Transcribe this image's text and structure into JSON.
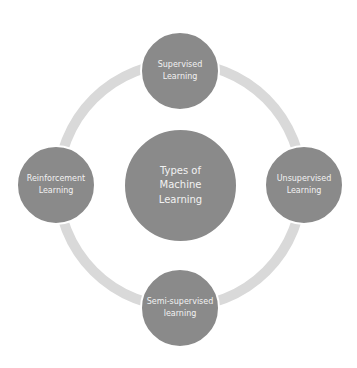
{
  "diagram": {
    "center": {
      "label": "Types of\nMachine\nLearning"
    },
    "nodes": [
      {
        "id": "top",
        "label": "Supervised\nLearning"
      },
      {
        "id": "right",
        "label": "Unsupervised\nLearning"
      },
      {
        "id": "bottom",
        "label": "Semi-supervised\nlearning"
      },
      {
        "id": "left",
        "label": "Reinforcement\nLearning"
      }
    ],
    "colors": {
      "node": "#8a8a8a",
      "ring": "#d9d9d9",
      "text": "#f2f2f2"
    }
  }
}
